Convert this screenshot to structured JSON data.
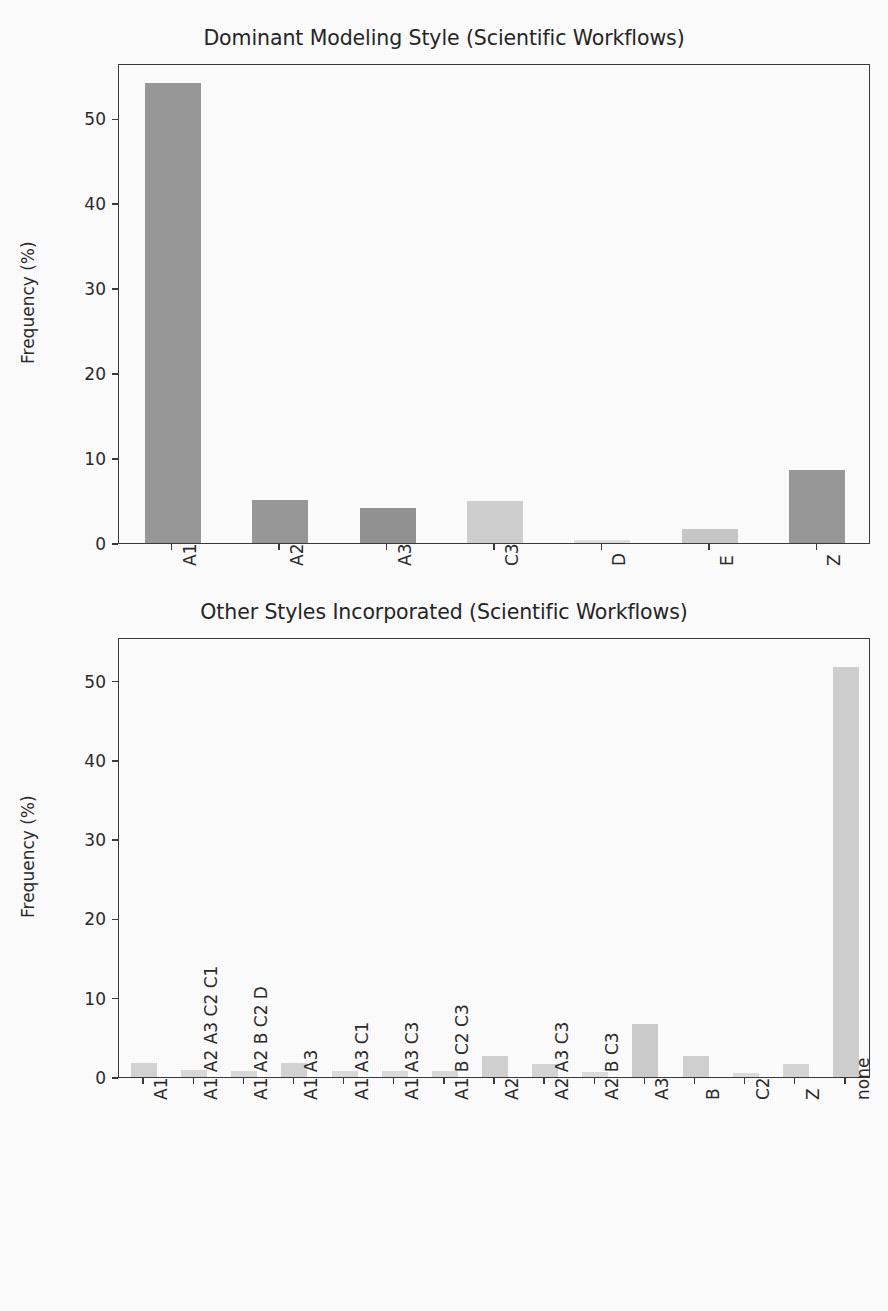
{
  "figure": {
    "width": 888,
    "height": 1311,
    "background": "#ffffff"
  },
  "chart_data": [
    {
      "type": "bar",
      "title": "Dominant Modeling Style (Scientific Workflows)",
      "xlabel": "",
      "ylabel": "Frequency (%)",
      "categories": [
        "A1",
        "A2",
        "A3",
        "C3",
        "D",
        "E",
        "Z"
      ],
      "values": [
        54.1,
        5.1,
        4.1,
        4.9,
        0.4,
        1.7,
        8.6
      ],
      "bar_colors": [
        "#9a9a9a",
        "#9a9a9a",
        "#949494",
        "#d2d2d2",
        "#e2e2e2",
        "#c9c9c9",
        "#9a9a9a"
      ],
      "yticks": [
        0,
        10,
        20,
        30,
        40,
        50
      ],
      "ytick_labels": [
        "0",
        "10",
        "20",
        "30",
        "40",
        "50"
      ],
      "ylim": [
        0,
        56.5
      ],
      "grid": false,
      "legend": "none",
      "xtick_rotation": -90
    },
    {
      "type": "bar",
      "title": "Other Styles Incorporated (Scientific Workflows)",
      "xlabel": "",
      "ylabel": "Frequency (%)",
      "categories": [
        "A1",
        "A1 A2 A3 C2 C1",
        "A1 A2 B C2 D",
        "A1 A3",
        "A1 A3 C1",
        "A1 A3 C3",
        "A1 B C2 C3",
        "A2",
        "A2 A3 C3",
        "A2 B C3",
        "A3",
        "B",
        "C2",
        "Z",
        "none"
      ],
      "values": [
        1.8,
        0.9,
        0.8,
        1.8,
        0.7,
        0.7,
        0.8,
        2.7,
        1.6,
        0.6,
        6.7,
        2.6,
        0.5,
        1.6,
        51.7
      ],
      "bar_colors": [
        "#d6d6d6",
        "#dcdcdc",
        "#dcdcdc",
        "#d6d6d6",
        "#dedede",
        "#dedede",
        "#dcdcdc",
        "#d3d3d3",
        "#d8d8d8",
        "#e0e0e0",
        "#cfcfcf",
        "#d3d3d3",
        "#e0e0e0",
        "#d8d8d8",
        "#d2d2d2"
      ],
      "yticks": [
        0,
        10,
        20,
        30,
        40,
        50
      ],
      "ytick_labels": [
        "0",
        "10",
        "20",
        "30",
        "40",
        "50"
      ],
      "ylim": [
        0,
        55.5
      ],
      "grid": false,
      "legend": "none",
      "xtick_rotation": -90
    }
  ],
  "axis_color": "#3b3b3b",
  "text_color": "#2b2b2b"
}
